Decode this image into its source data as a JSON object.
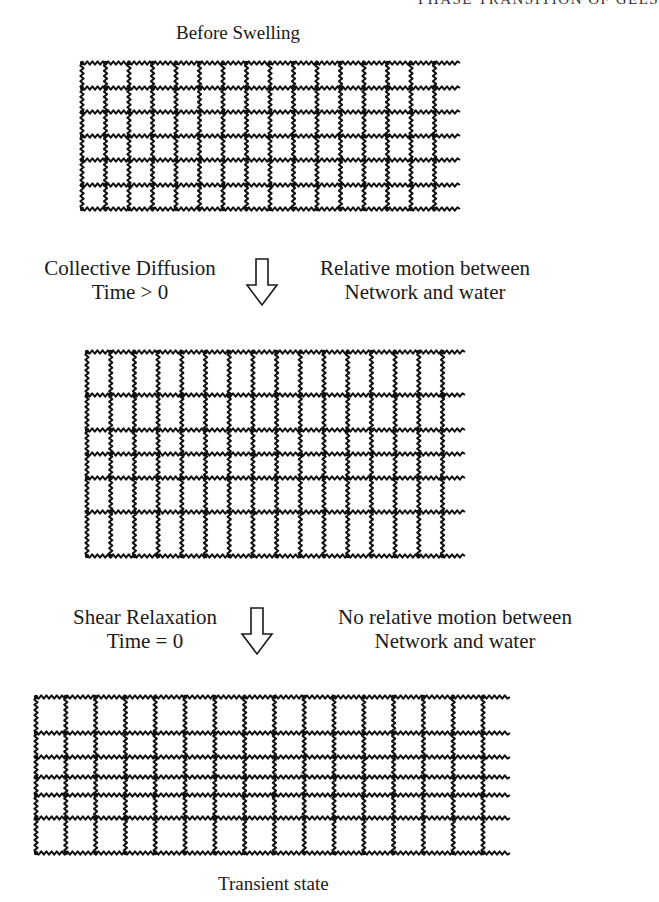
{
  "page": {
    "running_head": "PHASE TRANSITION OF GELS"
  },
  "figure": {
    "panels": [
      {
        "id": "before-swelling",
        "title": "Before Swelling",
        "grid": {
          "x_left": 82,
          "spacing": 23.5,
          "columns": 16,
          "tail_end": 460,
          "rows_y": [
            63,
            88,
            112,
            136,
            160,
            185,
            209
          ]
        }
      },
      {
        "id": "collective-diffusion-state",
        "grid": {
          "x_left": 87,
          "spacing": 23.7,
          "columns": 16,
          "tail_end": 465,
          "rows_y": [
            352,
            395,
            430,
            454,
            478,
            512,
            556
          ]
        }
      },
      {
        "id": "transient-state",
        "title": "Transient state",
        "grid": {
          "x_left": 36,
          "spacing": 29.8,
          "columns": 16,
          "tail_end": 510,
          "rows_y": [
            697,
            733,
            757,
            777,
            795,
            818,
            853
          ]
        }
      }
    ],
    "transitions": [
      {
        "id": "collective-diffusion",
        "left_line1": "Collective Diffusion",
        "left_line2": "Time > 0",
        "right_line1": "Relative motion between",
        "right_line2": "Network and water"
      },
      {
        "id": "shear-relaxation",
        "left_line1": "Shear Relaxation",
        "left_line2": "Time = 0",
        "right_line1": "No relative motion between",
        "right_line2": "Network and water"
      }
    ]
  }
}
